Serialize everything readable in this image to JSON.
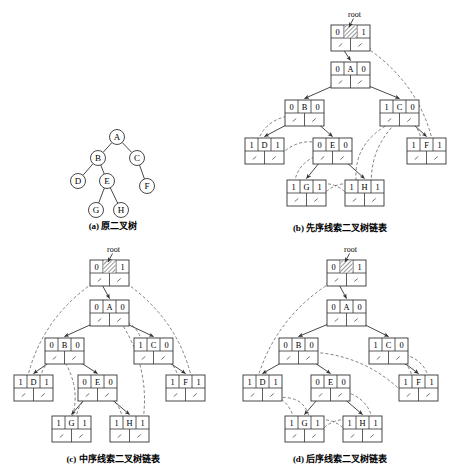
{
  "figure": {
    "root_label": "root"
  },
  "panels": [
    {
      "id": "a",
      "caption": "(a) 原二叉树",
      "type": "binary-tree",
      "nodes": [
        {
          "key": "A",
          "label": "A",
          "x": 117,
          "y": 137
        },
        {
          "key": "B",
          "label": "B",
          "x": 98,
          "y": 158
        },
        {
          "key": "C",
          "label": "C",
          "x": 137,
          "y": 158
        },
        {
          "key": "D",
          "label": "D",
          "x": 78,
          "y": 181
        },
        {
          "key": "E",
          "label": "E",
          "x": 107,
          "y": 181
        },
        {
          "key": "F",
          "label": "F",
          "x": 147,
          "y": 186
        },
        {
          "key": "G",
          "label": "G",
          "x": 96,
          "y": 210
        },
        {
          "key": "H",
          "label": "H",
          "x": 121,
          "y": 210
        }
      ],
      "edges": [
        {
          "from": "A",
          "to": "B"
        },
        {
          "from": "A",
          "to": "C"
        },
        {
          "from": "B",
          "to": "D"
        },
        {
          "from": "B",
          "to": "E"
        },
        {
          "from": "C",
          "to": "F"
        },
        {
          "from": "E",
          "to": "G"
        },
        {
          "from": "E",
          "to": "H"
        }
      ]
    },
    {
      "id": "b",
      "caption": "(b) 先序线索二叉树链表",
      "type": "threaded-list",
      "root_label": "root",
      "nodes": [
        {
          "key": "HEAD",
          "ltag": "0",
          "data": "",
          "rtag": "1",
          "hatched": true,
          "x": 104,
          "y": 25
        },
        {
          "key": "A",
          "ltag": "0",
          "data": "A",
          "rtag": "0",
          "x": 104,
          "y": 62
        },
        {
          "key": "B",
          "ltag": "0",
          "data": "B",
          "rtag": "0",
          "x": 58,
          "y": 100
        },
        {
          "key": "C",
          "ltag": "1",
          "data": "C",
          "rtag": "0",
          "x": 153,
          "y": 100
        },
        {
          "key": "D",
          "ltag": "1",
          "data": "D",
          "rtag": "1",
          "x": 18,
          "y": 138
        },
        {
          "key": "E",
          "ltag": "0",
          "data": "E",
          "rtag": "0",
          "x": 86,
          "y": 138
        },
        {
          "key": "F",
          "ltag": "1",
          "data": "F",
          "rtag": "1",
          "x": 180,
          "y": 138
        },
        {
          "key": "G",
          "ltag": "1",
          "data": "G",
          "rtag": "1",
          "x": 60,
          "y": 180
        },
        {
          "key": "H",
          "ltag": "1",
          "data": "H",
          "rtag": "1",
          "x": 118,
          "y": 180
        }
      ],
      "tree_edges": [
        {
          "from": "HEAD",
          "slot": "L",
          "to": "A"
        },
        {
          "from": "A",
          "slot": "L",
          "to": "B"
        },
        {
          "from": "A",
          "slot": "R",
          "to": "C"
        },
        {
          "from": "B",
          "slot": "L",
          "to": "D"
        },
        {
          "from": "B",
          "slot": "R",
          "to": "E"
        },
        {
          "from": "C",
          "slot": "R",
          "to": "F"
        },
        {
          "from": "E",
          "slot": "L",
          "to": "G"
        },
        {
          "from": "E",
          "slot": "R",
          "to": "H"
        }
      ],
      "thread_order": [
        "A",
        "B",
        "D",
        "E",
        "G",
        "H",
        "C",
        "F"
      ]
    },
    {
      "id": "c",
      "caption": "(c) 中序线索二叉树链表",
      "type": "threaded-list",
      "root_label": "root",
      "nodes": [
        {
          "key": "HEAD",
          "ltag": "0",
          "data": "",
          "rtag": "1",
          "hatched": true,
          "x": 90,
          "y": 20
        },
        {
          "key": "A",
          "ltag": "0",
          "data": "A",
          "rtag": "0",
          "x": 90,
          "y": 60
        },
        {
          "key": "B",
          "ltag": "0",
          "data": "B",
          "rtag": "0",
          "x": 45,
          "y": 98
        },
        {
          "key": "C",
          "ltag": "1",
          "data": "C",
          "rtag": "0",
          "x": 134,
          "y": 98
        },
        {
          "key": "D",
          "ltag": "1",
          "data": "D",
          "rtag": "1",
          "x": 14,
          "y": 135
        },
        {
          "key": "E",
          "ltag": "0",
          "data": "E",
          "rtag": "0",
          "x": 78,
          "y": 135
        },
        {
          "key": "F",
          "ltag": "1",
          "data": "F",
          "rtag": "1",
          "x": 166,
          "y": 135
        },
        {
          "key": "G",
          "ltag": "1",
          "data": "G",
          "rtag": "1",
          "x": 52,
          "y": 176
        },
        {
          "key": "H",
          "ltag": "1",
          "data": "H",
          "rtag": "1",
          "x": 110,
          "y": 176
        }
      ],
      "tree_edges": [
        {
          "from": "HEAD",
          "slot": "L",
          "to": "A"
        },
        {
          "from": "A",
          "slot": "L",
          "to": "B"
        },
        {
          "from": "A",
          "slot": "R",
          "to": "C"
        },
        {
          "from": "B",
          "slot": "L",
          "to": "D"
        },
        {
          "from": "B",
          "slot": "R",
          "to": "E"
        },
        {
          "from": "C",
          "slot": "R",
          "to": "F"
        },
        {
          "from": "E",
          "slot": "L",
          "to": "G"
        },
        {
          "from": "E",
          "slot": "R",
          "to": "H"
        }
      ],
      "thread_order": [
        "D",
        "B",
        "G",
        "E",
        "H",
        "A",
        "C",
        "F"
      ]
    },
    {
      "id": "d",
      "caption": "(d) 后序线索二叉树链表",
      "type": "threaded-list",
      "root_label": "root",
      "nodes": [
        {
          "key": "HEAD",
          "ltag": "0",
          "data": "",
          "rtag": "1",
          "hatched": true,
          "x": 100,
          "y": 20
        },
        {
          "key": "A",
          "ltag": "0",
          "data": "A",
          "rtag": "0",
          "x": 100,
          "y": 60
        },
        {
          "key": "B",
          "ltag": "0",
          "data": "B",
          "rtag": "0",
          "x": 52,
          "y": 98
        },
        {
          "key": "C",
          "ltag": "1",
          "data": "C",
          "rtag": "0",
          "x": 142,
          "y": 98
        },
        {
          "key": "D",
          "ltag": "1",
          "data": "D",
          "rtag": "1",
          "x": 16,
          "y": 135
        },
        {
          "key": "E",
          "ltag": "0",
          "data": "E",
          "rtag": "0",
          "x": 84,
          "y": 135
        },
        {
          "key": "F",
          "ltag": "1",
          "data": "F",
          "rtag": "1",
          "x": 172,
          "y": 135
        },
        {
          "key": "G",
          "ltag": "1",
          "data": "G",
          "rtag": "1",
          "x": 58,
          "y": 176
        },
        {
          "key": "H",
          "ltag": "1",
          "data": "H",
          "rtag": "1",
          "x": 116,
          "y": 176
        }
      ],
      "tree_edges": [
        {
          "from": "HEAD",
          "slot": "L",
          "to": "A"
        },
        {
          "from": "A",
          "slot": "L",
          "to": "B"
        },
        {
          "from": "A",
          "slot": "R",
          "to": "C"
        },
        {
          "from": "B",
          "slot": "L",
          "to": "D"
        },
        {
          "from": "B",
          "slot": "R",
          "to": "E"
        },
        {
          "from": "C",
          "slot": "R",
          "to": "F"
        },
        {
          "from": "E",
          "slot": "L",
          "to": "G"
        },
        {
          "from": "E",
          "slot": "R",
          "to": "H"
        }
      ],
      "thread_order": [
        "D",
        "G",
        "H",
        "E",
        "B",
        "F",
        "C",
        "A"
      ]
    }
  ],
  "style": {
    "stroke": "#333333",
    "thread_stroke": "#555555",
    "node_fill": "#ffffff",
    "hatch_color": "#444444",
    "text_color": "#000000"
  },
  "node_geometry": {
    "cell_w": 13,
    "cell_h": 13,
    "top_cells": 3,
    "bottom_cells": 2,
    "note": "each node: top row = [ltag, data, rtag], bottom row = [lchild ptr, rchild ptr]"
  }
}
